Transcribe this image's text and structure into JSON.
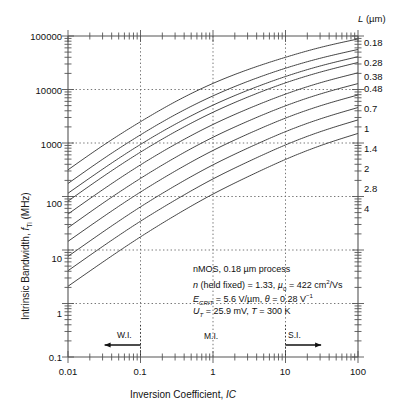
{
  "chart_data": {
    "type": "line",
    "title": "",
    "xlabel": "Inversion Coefficient, IC",
    "ylabel": "Intrinsic Bandwidth, fTi (MHz)",
    "xscale": "log",
    "yscale": "log",
    "xlim": [
      0.01,
      100
    ],
    "ylim": [
      0.1,
      100000
    ],
    "grid": true,
    "xticks": [
      "0.01",
      "0.1",
      "1",
      "10",
      "100"
    ],
    "xtick_values": [
      0.01,
      0.1,
      1,
      10,
      100
    ],
    "yticks": [
      "0.1",
      "1",
      "10",
      "100",
      "1000",
      "10000",
      "100000"
    ],
    "ytick_values": [
      0.1,
      1,
      10,
      100,
      1000,
      10000,
      100000
    ],
    "legend_position": "right-edge",
    "legend_title": "L (µm)",
    "x": [
      0.01,
      0.0316,
      0.1,
      0.316,
      1,
      3.16,
      10,
      31.6,
      100
    ],
    "series": [
      {
        "name": "0.18",
        "values": [
          315,
          930,
          2500,
          6100,
          13000,
          24000,
          40000,
          62000,
          88000
        ]
      },
      {
        "name": "0.28",
        "values": [
          175,
          520,
          1420,
          3500,
          7600,
          14500,
          25000,
          39000,
          56000
        ]
      },
      {
        "name": "0.38",
        "values": [
          115,
          340,
          940,
          2320,
          5100,
          9900,
          17500,
          28000,
          41000
        ]
      },
      {
        "name": "0.48",
        "values": [
          82,
          244,
          675,
          1680,
          3750,
          7400,
          13300,
          21500,
          32000
        ]
      },
      {
        "name": "0.7",
        "values": [
          47,
          140,
          390,
          980,
          2220,
          4450,
          8200,
          13600,
          20500
        ]
      },
      {
        "name": "1",
        "values": [
          26,
          78,
          218,
          555,
          1280,
          2620,
          4950,
          8400,
          12900
        ]
      },
      {
        "name": "1.4",
        "values": [
          14.5,
          43,
          121,
          310,
          725,
          1510,
          2920,
          5050,
          7900
        ]
      },
      {
        "name": "2",
        "values": [
          7.6,
          22.6,
          64,
          165,
          390,
          825,
          1630,
          2880,
          4600
        ]
      },
      {
        "name": "2.8",
        "values": [
          4.1,
          12.2,
          34.5,
          89,
          213,
          457,
          920,
          1660,
          2700
        ]
      },
      {
        "name": "4",
        "values": [
          2.1,
          6.2,
          17.6,
          46,
          111,
          241,
          493,
          910,
          1510
        ]
      }
    ],
    "annotations": {
      "lines": [
        "nMOS, 0.18 µm process",
        "n (held fixed) = 1.33,  µ0 = 422 cm2/Vs",
        "ECRIT = 5.6 V/µm,  θ = 0.28 V-1",
        "UT = 25.9 mV,  T = 300 K"
      ]
    },
    "region_markers": [
      {
        "label": "W.I.",
        "arrow": "left",
        "at_x": 0.1
      },
      {
        "label": "M.I.",
        "arrow": "none",
        "at_x": 1
      },
      {
        "label": "S.I.",
        "arrow": "right",
        "at_x": 10
      }
    ]
  },
  "axes": {
    "y_title_prefix": "Intrinsic Bandwidth, ",
    "y_title_sym": "f",
    "y_title_sub": "Ti",
    "y_title_suffix": " (MHz)",
    "x_title_prefix": "Inversion Coefficient, ",
    "x_title_sym": "IC",
    "y_labels": [
      "100000",
      "10000",
      "1000",
      "100",
      "10",
      "1",
      "0.1"
    ],
    "x_labels": [
      "0.01",
      "0.1",
      "1",
      "10",
      "100"
    ]
  },
  "legend": {
    "header_sym": "L",
    "header_unit": " (µm)",
    "labels": [
      "0.18",
      "0.28",
      "0.38",
      "0.48",
      "0.7",
      "1",
      "1.4",
      "2",
      "2.8",
      "4"
    ]
  },
  "annotation_box": {
    "line1": "nMOS, 0.18 µm process",
    "line2_a": "n",
    "line2_b": " (held fixed) = 1.33, ",
    "line2_c": "µ",
    "line2_d": "0",
    "line2_e": " = 422 cm",
    "line2_f": "2",
    "line2_g": "/Vs",
    "line3_a": "E",
    "line3_b": "CRIT",
    "line3_c": " = 5.6 V/µm, ",
    "line3_d": "θ",
    "line3_e": " = 0.28 V",
    "line3_f": "−1",
    "line4_a": "U",
    "line4_b": "T",
    "line4_c": " = 25.9 mV, ",
    "line4_d": "T",
    "line4_e": " = 300 K"
  },
  "regions": {
    "wi": "W.I.",
    "mi": "M.I.",
    "si": "S.I."
  },
  "colors": {
    "curve": "#444444",
    "axis": "#555555",
    "grid": "#666666",
    "text": "#111111",
    "background": "#ffffff"
  }
}
